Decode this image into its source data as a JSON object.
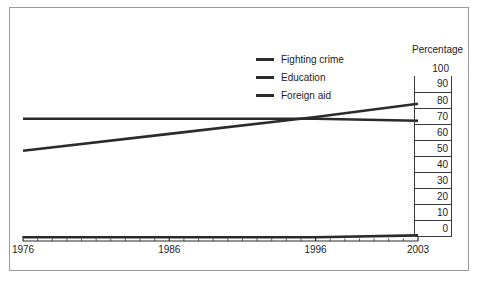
{
  "figure": {
    "background_color": "#ffffff",
    "border_color": "#9a9a9a"
  },
  "scale": {
    "title": "Percentage",
    "top_label": "100",
    "cells": [
      "90",
      "80",
      "70",
      "60",
      "50",
      "40",
      "30",
      "20",
      "10",
      "0"
    ]
  },
  "legend": {
    "entries": [
      {
        "label": "Fighting crime",
        "color": "#2b2b2b"
      },
      {
        "label": "Education",
        "color": "#2b2b2b"
      },
      {
        "label": "Foreign aid",
        "color": "#2b2b2b"
      }
    ]
  },
  "xaxis": {
    "ticks": [
      {
        "label": "1976",
        "pos_pct": 0
      },
      {
        "label": "1986",
        "pos_pct": 37.04
      },
      {
        "label": "1996",
        "pos_pct": 74.07
      },
      {
        "label": "2003",
        "pos_pct": 100
      }
    ]
  },
  "chart_data": {
    "type": "line",
    "title": "",
    "xlabel": "",
    "ylabel": "Percentage",
    "xlim": [
      1976,
      2003
    ],
    "ylim": [
      0,
      100
    ],
    "yticks": [
      0,
      10,
      20,
      30,
      40,
      50,
      60,
      70,
      80,
      90,
      100
    ],
    "xticks": [
      1976,
      1986,
      1996,
      2003
    ],
    "grid": false,
    "legend_position": "upper-center-right",
    "x": [
      1976,
      1986,
      1996,
      2003
    ],
    "series": [
      {
        "name": "Fighting crime",
        "color": "#2b2b2b",
        "values": [
          65,
          65,
          65,
          64
        ]
      },
      {
        "name": "Education",
        "color": "#2b2b2b",
        "values": [
          48,
          57,
          66,
          73
        ]
      },
      {
        "name": "Foreign aid",
        "color": "#2b2b2b",
        "values": [
          2,
          2,
          2,
          3
        ]
      }
    ],
    "annotations": [
      "Education crosses Fighting crime at approximately 1993"
    ]
  }
}
